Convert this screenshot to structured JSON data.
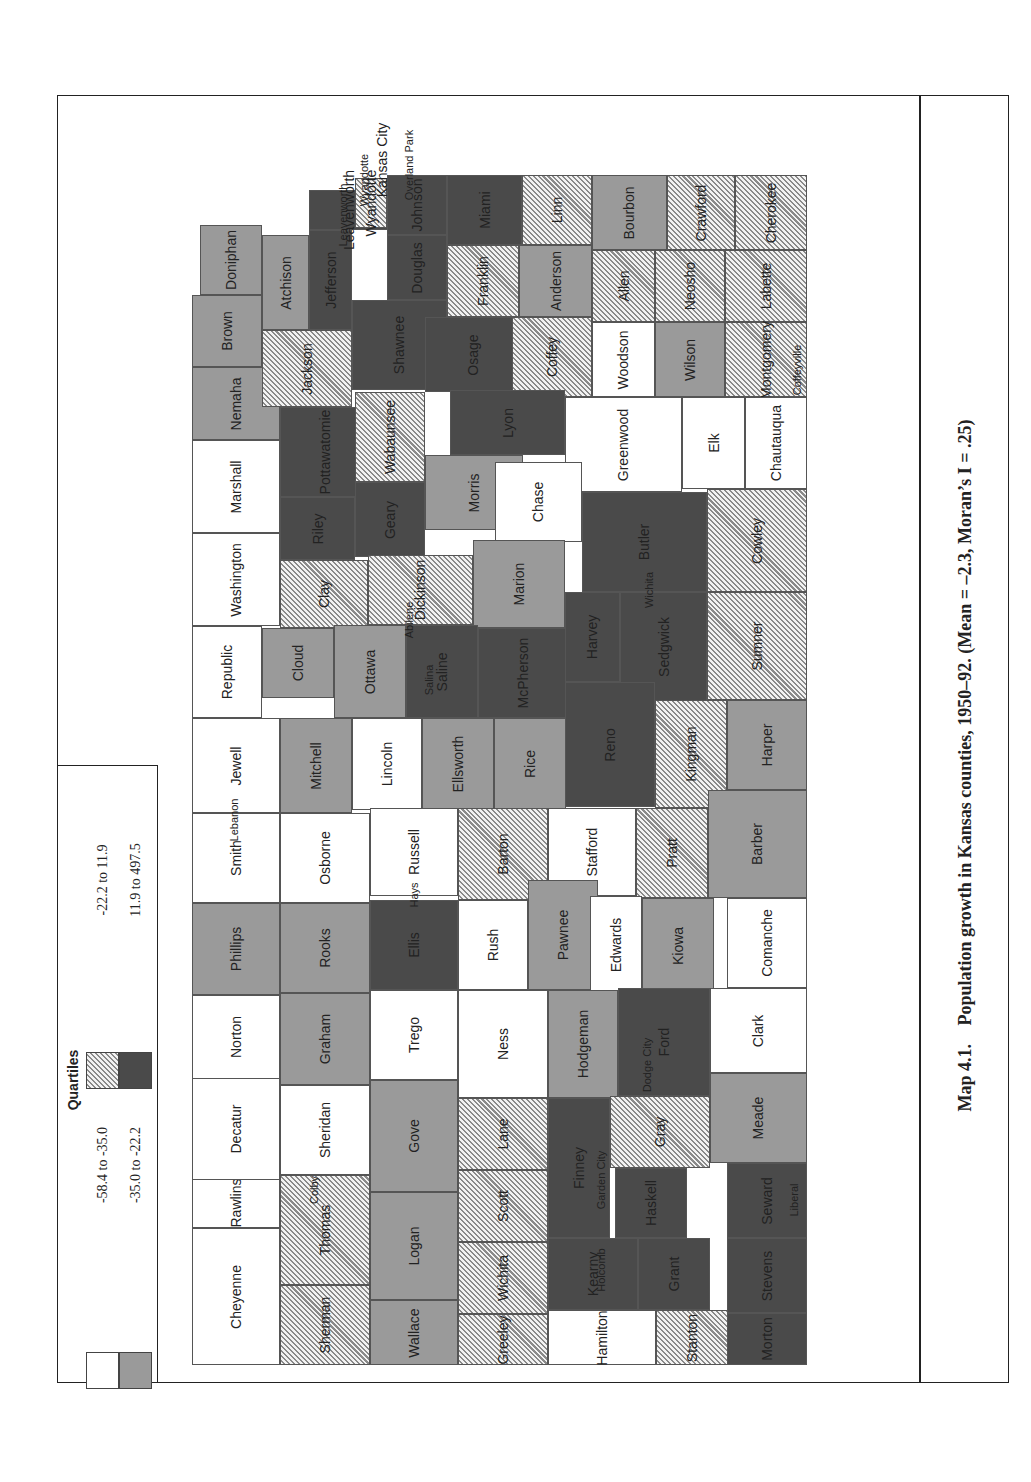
{
  "figure": {
    "caption_number": "Map 4.1.",
    "caption_text": "Population growth in Kansas counties, 1950–92. (Mean = –2.3, Moran’s I = .25)"
  },
  "legend": {
    "title": "Quartiles",
    "classes": [
      {
        "id": "q1",
        "label": "-58.4 to -35.0",
        "fill": "#ffffff",
        "pattern": "solid"
      },
      {
        "id": "q2",
        "label": "-35.0 to -22.2",
        "fill": "#9a9a9a",
        "pattern": "solid"
      },
      {
        "id": "q3",
        "label": "-22.2 to 11.9",
        "fill": "#c8c8c8",
        "pattern": "hatched"
      },
      {
        "id": "q4",
        "label": "11.9 to 497.5",
        "fill": "#4a4a4a",
        "pattern": "solid"
      }
    ]
  },
  "map": {
    "orientation": "rotated 90° counter-clockwise (north to the left)",
    "counties": [
      {
        "name": "Cheyenne",
        "q": "q1",
        "x": 192,
        "y": 1228,
        "w": 88,
        "h": 137
      },
      {
        "name": "Rawlins",
        "q": "q1",
        "x": 192,
        "y": 1178,
        "w": 88,
        "h": 50,
        "hy": 1120,
        "hh": 108
      },
      {
        "name": "Decatur",
        "q": "q1",
        "x": 192,
        "y": 1077,
        "w": 88,
        "h": 103
      },
      {
        "name": "Norton",
        "q": "q1",
        "x": 192,
        "y": 995,
        "w": 88,
        "h": 84
      },
      {
        "name": "Phillips",
        "q": "q2",
        "x": 192,
        "y": 903,
        "w": 88,
        "h": 92
      },
      {
        "name": "Smith",
        "q": "q1",
        "x": 192,
        "y": 813,
        "w": 88,
        "h": 90
      },
      {
        "name": "Jewell",
        "q": "q1",
        "x": 192,
        "y": 718,
        "w": 88,
        "h": 95
      },
      {
        "name": "Republic",
        "q": "q1",
        "x": 192,
        "y": 626,
        "w": 70,
        "h": 92
      },
      {
        "name": "Washington",
        "q": "q1",
        "x": 192,
        "y": 533,
        "w": 88,
        "h": 93
      },
      {
        "name": "Marshall",
        "q": "q1",
        "x": 192,
        "y": 440,
        "w": 88,
        "h": 93
      },
      {
        "name": "Nemaha",
        "q": "q2",
        "x": 192,
        "y": 367,
        "w": 88,
        "h": 73
      },
      {
        "name": "Brown",
        "q": "q2",
        "x": 192,
        "y": 295,
        "w": 70,
        "h": 72
      },
      {
        "name": "Doniphan",
        "q": "q2",
        "x": 200,
        "y": 225,
        "w": 62,
        "h": 70
      },
      {
        "name": "Atchison",
        "q": "q2",
        "x": 262,
        "y": 235,
        "w": 47,
        "h": 95
      },
      {
        "name": "Jackson",
        "q": "q3",
        "x": 262,
        "y": 330,
        "w": 90,
        "h": 77
      },
      {
        "name": "Jefferson",
        "q": "q4",
        "x": 309,
        "y": 230,
        "w": 43,
        "h": 100
      },
      {
        "name": "Leavenworth",
        "q": "q4",
        "x": 309,
        "y": 190,
        "w": 80,
        "h": 40
      },
      {
        "name": "Wyandotte",
        "q": "q3",
        "x": 355,
        "y": 178,
        "w": 32,
        "h": 50
      },
      {
        "name": "Johnson",
        "q": "q4",
        "x": 387,
        "y": 175,
        "w": 60,
        "h": 60
      },
      {
        "name": "Douglas",
        "q": "q4",
        "x": 387,
        "y": 235,
        "w": 60,
        "h": 65
      },
      {
        "name": "Miami",
        "q": "q4",
        "x": 447,
        "y": 175,
        "w": 75,
        "h": 70
      },
      {
        "name": "Linn",
        "q": "q3",
        "x": 522,
        "y": 175,
        "w": 70,
        "h": 70
      },
      {
        "name": "Bourbon",
        "q": "q2",
        "x": 592,
        "y": 175,
        "w": 75,
        "h": 75
      },
      {
        "name": "Crawford",
        "q": "q3",
        "x": 667,
        "y": 175,
        "w": 68,
        "h": 75
      },
      {
        "name": "Cherokee",
        "q": "q3",
        "x": 735,
        "y": 175,
        "w": 72,
        "h": 75
      },
      {
        "name": "Shawnee",
        "q": "q4",
        "x": 352,
        "y": 300,
        "w": 95,
        "h": 90
      },
      {
        "name": "Franklin",
        "q": "q3",
        "x": 447,
        "y": 245,
        "w": 72,
        "h": 72
      },
      {
        "name": "Osage",
        "q": "q4",
        "x": 425,
        "y": 317,
        "w": 95,
        "h": 75
      },
      {
        "name": "Anderson",
        "q": "q2",
        "x": 519,
        "y": 245,
        "w": 73,
        "h": 72
      },
      {
        "name": "Coffey",
        "q": "q3",
        "x": 512,
        "y": 317,
        "w": 80,
        "h": 80
      },
      {
        "name": "Allen",
        "q": "q3",
        "x": 592,
        "y": 250,
        "w": 63,
        "h": 72
      },
      {
        "name": "Woodson",
        "q": "q1",
        "x": 592,
        "y": 322,
        "w": 63,
        "h": 75
      },
      {
        "name": "Neosho",
        "q": "q3",
        "x": 655,
        "y": 250,
        "w": 70,
        "h": 72
      },
      {
        "name": "Wilson",
        "q": "q2",
        "x": 655,
        "y": 322,
        "w": 70,
        "h": 75
      },
      {
        "name": "Labette",
        "q": "q3",
        "x": 725,
        "y": 250,
        "w": 82,
        "h": 72
      },
      {
        "name": "Montgomery",
        "q": "q3",
        "x": 725,
        "y": 322,
        "w": 82,
        "h": 75
      },
      {
        "name": "Pottawatomie",
        "q": "q4",
        "x": 280,
        "y": 407,
        "w": 90,
        "h": 90
      },
      {
        "name": "Wabaunsee",
        "q": "q3",
        "x": 355,
        "y": 392,
        "w": 70,
        "h": 90
      },
      {
        "name": "Lyon",
        "q": "q4",
        "x": 450,
        "y": 390,
        "w": 115,
        "h": 65
      },
      {
        "name": "Greenwood",
        "q": "q1",
        "x": 565,
        "y": 397,
        "w": 117,
        "h": 95
      },
      {
        "name": "Elk",
        "q": "q1",
        "x": 682,
        "y": 397,
        "w": 63,
        "h": 92
      },
      {
        "name": "Chautauqua",
        "q": "q1",
        "x": 745,
        "y": 397,
        "w": 62,
        "h": 92
      },
      {
        "name": "Riley",
        "q": "q4",
        "x": 280,
        "y": 497,
        "w": 75,
        "h": 63
      },
      {
        "name": "Geary",
        "q": "q4",
        "x": 355,
        "y": 482,
        "w": 70,
        "h": 75
      },
      {
        "name": "Morris",
        "q": "q2",
        "x": 425,
        "y": 455,
        "w": 98,
        "h": 75
      },
      {
        "name": "Chase",
        "q": "q1",
        "x": 495,
        "y": 462,
        "w": 87,
        "h": 80
      },
      {
        "name": "Butler",
        "q": "q4",
        "x": 582,
        "y": 492,
        "w": 125,
        "h": 100
      },
      {
        "name": "Cowley",
        "q": "q3",
        "x": 707,
        "y": 489,
        "w": 100,
        "h": 103
      },
      {
        "name": "Clay",
        "q": "q3",
        "x": 280,
        "y": 560,
        "w": 88,
        "h": 68
      },
      {
        "name": "Dickinson",
        "q": "q3",
        "x": 368,
        "y": 555,
        "w": 105,
        "h": 70
      },
      {
        "name": "Marion",
        "q": "q2",
        "x": 473,
        "y": 540,
        "w": 92,
        "h": 88
      },
      {
        "name": "Cloud",
        "q": "q2",
        "x": 262,
        "y": 628,
        "w": 72,
        "h": 70
      },
      {
        "name": "Ottawa",
        "q": "q2",
        "x": 334,
        "y": 625,
        "w": 72,
        "h": 93
      },
      {
        "name": "Saline",
        "q": "q4",
        "x": 406,
        "y": 625,
        "w": 72,
        "h": 93
      },
      {
        "name": "McPherson",
        "q": "q4",
        "x": 478,
        "y": 628,
        "w": 90,
        "h": 90
      },
      {
        "name": "Harvey",
        "q": "q4",
        "x": 565,
        "y": 592,
        "w": 55,
        "h": 90
      },
      {
        "name": "Sedgwick",
        "q": "q4",
        "x": 620,
        "y": 592,
        "w": 87,
        "h": 110
      },
      {
        "name": "Sumner",
        "q": "q3",
        "x": 707,
        "y": 592,
        "w": 100,
        "h": 108
      },
      {
        "name": "Mitchell",
        "q": "q2",
        "x": 280,
        "y": 718,
        "w": 72,
        "h": 95
      },
      {
        "name": "Lincoln",
        "q": "q1",
        "x": 352,
        "y": 718,
        "w": 70,
        "h": 92
      },
      {
        "name": "Ellsworth",
        "q": "q2",
        "x": 422,
        "y": 718,
        "w": 72,
        "h": 92
      },
      {
        "name": "Rice",
        "q": "q2",
        "x": 494,
        "y": 718,
        "w": 72,
        "h": 92
      },
      {
        "name": "Reno",
        "q": "q4",
        "x": 565,
        "y": 682,
        "w": 90,
        "h": 125
      },
      {
        "name": "Kingman",
        "q": "q3",
        "x": 655,
        "y": 700,
        "w": 72,
        "h": 108
      },
      {
        "name": "Harper",
        "q": "q2",
        "x": 727,
        "y": 700,
        "w": 80,
        "h": 90
      },
      {
        "name": "Osborne",
        "q": "q1",
        "x": 280,
        "y": 813,
        "w": 90,
        "h": 90
      },
      {
        "name": "Russell",
        "q": "q1",
        "x": 370,
        "y": 808,
        "w": 88,
        "h": 88
      },
      {
        "name": "Barton",
        "q": "q3",
        "x": 458,
        "y": 808,
        "w": 90,
        "h": 92
      },
      {
        "name": "Stafford",
        "q": "q1",
        "x": 548,
        "y": 808,
        "w": 88,
        "h": 88
      },
      {
        "name": "Pratt",
        "q": "q3",
        "x": 636,
        "y": 808,
        "w": 72,
        "h": 90
      },
      {
        "name": "Barber",
        "q": "q2",
        "x": 708,
        "y": 790,
        "w": 99,
        "h": 108
      },
      {
        "name": "Rooks",
        "q": "q2",
        "x": 280,
        "y": 903,
        "w": 90,
        "h": 90
      },
      {
        "name": "Ellis",
        "q": "q4",
        "x": 370,
        "y": 900,
        "w": 88,
        "h": 90
      },
      {
        "name": "Rush",
        "q": "q1",
        "x": 458,
        "y": 900,
        "w": 70,
        "h": 90
      },
      {
        "name": "Pawnee",
        "q": "q2",
        "x": 528,
        "y": 880,
        "w": 70,
        "h": 110
      },
      {
        "name": "Edwards",
        "q": "q1",
        "x": 590,
        "y": 896,
        "w": 52,
        "h": 98
      },
      {
        "name": "Kiowa",
        "q": "q2",
        "x": 642,
        "y": 898,
        "w": 72,
        "h": 95
      },
      {
        "name": "Comanche",
        "q": "q1",
        "x": 727,
        "y": 898,
        "w": 80,
        "h": 90
      },
      {
        "name": "Graham",
        "q": "q2",
        "x": 280,
        "y": 993,
        "w": 90,
        "h": 92
      },
      {
        "name": "Trego",
        "q": "q1",
        "x": 370,
        "y": 990,
        "w": 88,
        "h": 90
      },
      {
        "name": "Ness",
        "q": "q1",
        "x": 458,
        "y": 990,
        "w": 90,
        "h": 108
      },
      {
        "name": "Hodgeman",
        "q": "q2",
        "x": 548,
        "y": 990,
        "w": 70,
        "h": 108
      },
      {
        "name": "Ford",
        "q": "q4",
        "x": 618,
        "y": 988,
        "w": 92,
        "h": 108
      },
      {
        "name": "Clark",
        "q": "q1",
        "x": 710,
        "y": 988,
        "w": 97,
        "h": 85
      },
      {
        "name": "Sheridan",
        "q": "q1",
        "x": 280,
        "y": 1085,
        "w": 90,
        "h": 90
      },
      {
        "name": "Gove",
        "q": "q2",
        "x": 370,
        "y": 1080,
        "w": 88,
        "h": 112
      },
      {
        "name": "Lane",
        "q": "q3",
        "x": 458,
        "y": 1098,
        "w": 90,
        "h": 72
      },
      {
        "name": "Finney",
        "q": "q4",
        "x": 548,
        "y": 1098,
        "w": 62,
        "h": 140
      },
      {
        "name": "Gray",
        "q": "q3",
        "x": 610,
        "y": 1096,
        "w": 100,
        "h": 72
      },
      {
        "name": "Meade",
        "q": "q2",
        "x": 710,
        "y": 1073,
        "w": 97,
        "h": 90
      },
      {
        "name": "Thomas",
        "q": "q3",
        "x": 280,
        "y": 1175,
        "w": 90,
        "h": 110
      },
      {
        "name": "Logan",
        "q": "q2",
        "x": 370,
        "y": 1192,
        "w": 88,
        "h": 108
      },
      {
        "name": "Scott",
        "q": "q3",
        "x": 458,
        "y": 1170,
        "w": 90,
        "h": 72
      },
      {
        "name": "Haskell",
        "q": "q4",
        "x": 615,
        "y": 1168,
        "w": 72,
        "h": 70
      },
      {
        "name": "Seward",
        "q": "q4",
        "x": 727,
        "y": 1163,
        "w": 80,
        "h": 75
      },
      {
        "name": "Sherman",
        "q": "q3",
        "x": 280,
        "y": 1285,
        "w": 90,
        "h": 80
      },
      {
        "name": "Wallace",
        "q": "q2",
        "x": 370,
        "y": 1300,
        "w": 88,
        "h": 65
      },
      {
        "name": "Wichita",
        "q": "q3",
        "x": 458,
        "y": 1242,
        "w": 90,
        "h": 72
      },
      {
        "name": "Kearny",
        "q": "q4",
        "x": 548,
        "y": 1238,
        "w": 90,
        "h": 72
      },
      {
        "name": "Grant",
        "q": "q4",
        "x": 638,
        "y": 1238,
        "w": 72,
        "h": 72
      },
      {
        "name": "Stevens",
        "q": "q4",
        "x": 727,
        "y": 1238,
        "w": 80,
        "h": 75
      },
      {
        "name": "Greeley",
        "q": "q3",
        "x": 458,
        "y": 1314,
        "w": 90,
        "h": 51
      },
      {
        "name": "Hamilton",
        "q": "q1",
        "x": 548,
        "y": 1310,
        "w": 108,
        "h": 55
      },
      {
        "name": "Stanton",
        "q": "q3",
        "x": 656,
        "y": 1310,
        "w": 72,
        "h": 55
      },
      {
        "name": "Morton",
        "q": "q4",
        "x": 727,
        "y": 1313,
        "w": 80,
        "h": 52
      }
    ],
    "cities": [
      {
        "name": "Kansas City",
        "x": 367,
        "y": 100,
        "w": 30,
        "h": 120,
        "big": true
      },
      {
        "name": "Overland Park",
        "x": 397,
        "y": 115,
        "w": 24,
        "h": 100
      },
      {
        "name": "Wyandotte",
        "x": 352,
        "y": 150,
        "w": 24,
        "h": 60
      },
      {
        "name": "Leavenworth",
        "x": 330,
        "y": 165,
        "w": 24,
        "h": 100
      },
      {
        "name": "Lebanon",
        "x": 225,
        "y": 790,
        "w": 18,
        "h": 60
      },
      {
        "name": "Hays",
        "x": 405,
        "y": 875,
        "w": 18,
        "h": 40
      },
      {
        "name": "Colby",
        "x": 305,
        "y": 1170,
        "w": 18,
        "h": 40
      },
      {
        "name": "Abilene",
        "x": 400,
        "y": 590,
        "w": 18,
        "h": 60
      },
      {
        "name": "Salina",
        "x": 420,
        "y": 655,
        "w": 18,
        "h": 50
      },
      {
        "name": "Wichita",
        "x": 640,
        "y": 555,
        "w": 18,
        "h": 70
      },
      {
        "name": "Dodge City",
        "x": 638,
        "y": 1025,
        "w": 18,
        "h": 80
      },
      {
        "name": "Garden City",
        "x": 592,
        "y": 1140,
        "w": 18,
        "h": 80
      },
      {
        "name": "Holcomb",
        "x": 592,
        "y": 1240,
        "w": 18,
        "h": 60
      },
      {
        "name": "Liberal",
        "x": 785,
        "y": 1175,
        "w": 18,
        "h": 50
      },
      {
        "name": "Coffeyville",
        "x": 788,
        "y": 330,
        "w": 18,
        "h": 80
      }
    ]
  }
}
